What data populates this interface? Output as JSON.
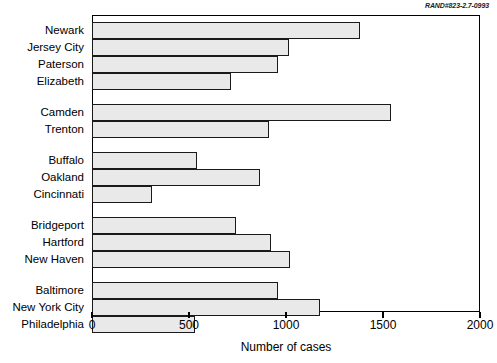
{
  "document_id": "RAND#823-2.7-0993",
  "chart_data": {
    "type": "bar",
    "orientation": "horizontal",
    "title": "",
    "xlabel": "Number of cases",
    "ylabel": "",
    "xlim": [
      0,
      2000
    ],
    "xticks": [
      0,
      500,
      1000,
      1500,
      2000
    ],
    "xticklabels": [
      "0",
      "500",
      "1000",
      "1500",
      "2000"
    ],
    "grid": false,
    "legend": false,
    "bar_fill_color": "#e9e9e9",
    "bar_edge_color": "#1a1a1a",
    "categories": [
      "Newark",
      "Jersey City",
      "Paterson",
      "Elizabeth",
      "Camden",
      "Trenton",
      "Buffalo",
      "Oakland",
      "Cincinnati",
      "Bridgeport",
      "Hartford",
      "New Haven",
      "Baltimore",
      "New York City",
      "Philadelphia"
    ],
    "values": [
      1380,
      1015,
      960,
      715,
      1540,
      910,
      540,
      865,
      310,
      740,
      925,
      1020,
      960,
      1175,
      530
    ],
    "groups": [
      {
        "name": "group-1",
        "categories": [
          "Newark",
          "Jersey City",
          "Paterson",
          "Elizabeth"
        ]
      },
      {
        "name": "group-2",
        "categories": [
          "Camden",
          "Trenton"
        ]
      },
      {
        "name": "group-3",
        "categories": [
          "Buffalo",
          "Oakland",
          "Cincinnati"
        ]
      },
      {
        "name": "group-4",
        "categories": [
          "Bridgeport",
          "Hartford",
          "New Haven"
        ]
      },
      {
        "name": "group-5",
        "categories": [
          "Baltimore",
          "New York City",
          "Philadelphia"
        ]
      }
    ]
  }
}
